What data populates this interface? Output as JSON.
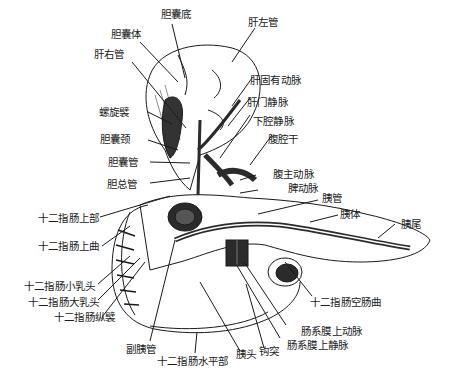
{
  "figure": {
    "type": "anatomical-illustration",
    "colors": {
      "ink": "#1a1a1a",
      "dark_fill": "#2b2b2b",
      "background": "#ffffff"
    }
  },
  "labels": {
    "gallbladder_fundus": "胆囊底",
    "gallbladder_body": "胆囊体",
    "right_hepatic_duct": "肝右管",
    "left_hepatic_duct": "肝左管",
    "proper_hepatic_artery": "肝固有动脉",
    "hepatic_portal_vein": "肝门静脉",
    "inferior_vena_cava": "下腔静脉",
    "celiac_trunk": "腹腔干",
    "spiral_fold": "螺旋襞",
    "gallbladder_neck": "胆囊颈",
    "cystic_duct": "胆囊管",
    "common_bile_duct": "胆总管",
    "abdominal_aorta": "腹主动脉",
    "splenic_artery": "脾动脉",
    "pancreatic_duct": "胰管",
    "pancreas_body": "胰体",
    "pancreas_tail": "胰尾",
    "duodenum_superior_part": "十二指肠上部",
    "duodenum_superior_flexure": "十二指肠上曲",
    "minor_duodenal_papilla": "十二指肠小乳头",
    "major_duodenal_papilla": "十二指肠大乳头",
    "longitudinal_fold_duodenum": "十二指肠纵襞",
    "accessory_pancreatic_duct": "副胰管",
    "duodenum_horizontal_part": "十二指肠水平部",
    "pancreas_head": "胰头",
    "uncinate_process": "钩突",
    "duodenojejunal_flexure": "十二指肠空肠曲",
    "superior_mesenteric_artery": "肠系膜上动脉",
    "superior_mesenteric_vein": "肠系膜上静脉"
  }
}
